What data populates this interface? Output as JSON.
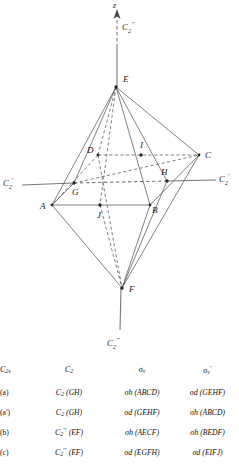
{
  "figure": {
    "axes": {
      "z_label": "z",
      "vertical_axis_top_label": {
        "base": "C",
        "sub": "2",
        "prime": "′′"
      },
      "vertical_axis_bottom_label": {
        "base": "C",
        "sub": "2",
        "prime": "′′"
      },
      "left_axis_label": {
        "base": "C",
        "sub": "2",
        "prime": "′"
      },
      "right_axis_label": {
        "base": "C",
        "sub": "2",
        "prime": "′"
      }
    },
    "vertices": [
      {
        "id": "E",
        "label": "E",
        "x": 116,
        "y": 87,
        "lx": 123,
        "ly": 82
      },
      {
        "id": "D",
        "label": "D",
        "x": 98,
        "y": 155,
        "lx": 88,
        "ly": 153
      },
      {
        "id": "I",
        "label": "I",
        "x": 141,
        "y": 155,
        "lx": 141,
        "ly": 147
      },
      {
        "id": "C",
        "label": "C",
        "x": 199,
        "y": 155,
        "lx": 205,
        "ly": 157
      },
      {
        "id": "G",
        "label": "G",
        "x": 74,
        "y": 183,
        "lx": 74,
        "ly": 194
      },
      {
        "id": "H",
        "label": "H",
        "x": 167,
        "y": 181,
        "lx": 163,
        "ly": 174
      },
      {
        "id": "A",
        "label": "A",
        "x": 52,
        "y": 205,
        "lx": 41,
        "ly": 207
      },
      {
        "id": "J",
        "label": "J",
        "x": 100,
        "y": 205,
        "lx": 98,
        "ly": 217
      },
      {
        "id": "B",
        "label": "B",
        "x": 150,
        "y": 205,
        "lx": 152,
        "ly": 212
      },
      {
        "id": "F",
        "label": "F",
        "x": 122,
        "y": 288,
        "lx": 129,
        "ly": 292
      }
    ]
  },
  "table": {
    "columns": [
      {
        "key": "case",
        "label": null
      },
      {
        "key": "c2",
        "label": {
          "base": "C",
          "sub": "2",
          "prime": ""
        }
      },
      {
        "key": "sv",
        "label": {
          "base": "σ",
          "sub": "v",
          "prime": ""
        }
      },
      {
        "key": "svp",
        "label": {
          "base": "σ",
          "sub": "v",
          "prime": "′"
        }
      }
    ],
    "header": {
      "corner": {
        "base": "C",
        "sub": "2v",
        "prime": ""
      }
    },
    "rows": [
      {
        "case": "(a)",
        "c2": {
          "base": "C",
          "sub": "2",
          "prime": "",
          "group": "(GH)"
        },
        "sv": {
          "base": "σ",
          "sub": "h",
          "prime": "",
          "group": "(ABCD)"
        },
        "svp": {
          "base": "σ",
          "sub": "d",
          "prime": "",
          "group": "(GEHF)"
        }
      },
      {
        "case": "(a′)",
        "c2": {
          "base": "C",
          "sub": "2",
          "prime": "",
          "group": "(GH)"
        },
        "sv": {
          "base": "σ",
          "sub": "d",
          "prime": "",
          "group": "(GEHF)"
        },
        "svp": {
          "base": "σ",
          "sub": "h",
          "prime": "",
          "group": "(ABCD)"
        }
      },
      {
        "case": "(b)",
        "c2": {
          "base": "C",
          "sub": "2",
          "prime": "′′",
          "group": "(EF)"
        },
        "sv": {
          "base": "σ",
          "sub": "h",
          "prime": "",
          "group": "(AECF)"
        },
        "svp": {
          "base": "σ",
          "sub": "h",
          "prime": "",
          "group": "(BEDF)"
        }
      },
      {
        "case": "(c)",
        "c2": {
          "base": "C",
          "sub": "2",
          "prime": "′′",
          "group": "(EF)"
        },
        "sv": {
          "base": "σ",
          "sub": "d",
          "prime": "",
          "group": "(EGFH)"
        },
        "svp": {
          "base": "σ",
          "sub": "d",
          "prime": "",
          "group": "(EIFJ)"
        }
      }
    ]
  },
  "colors": {
    "edge": "#55575c",
    "axis": "#76787d",
    "text": "#1a1a1a",
    "background": "#ffffff"
  }
}
